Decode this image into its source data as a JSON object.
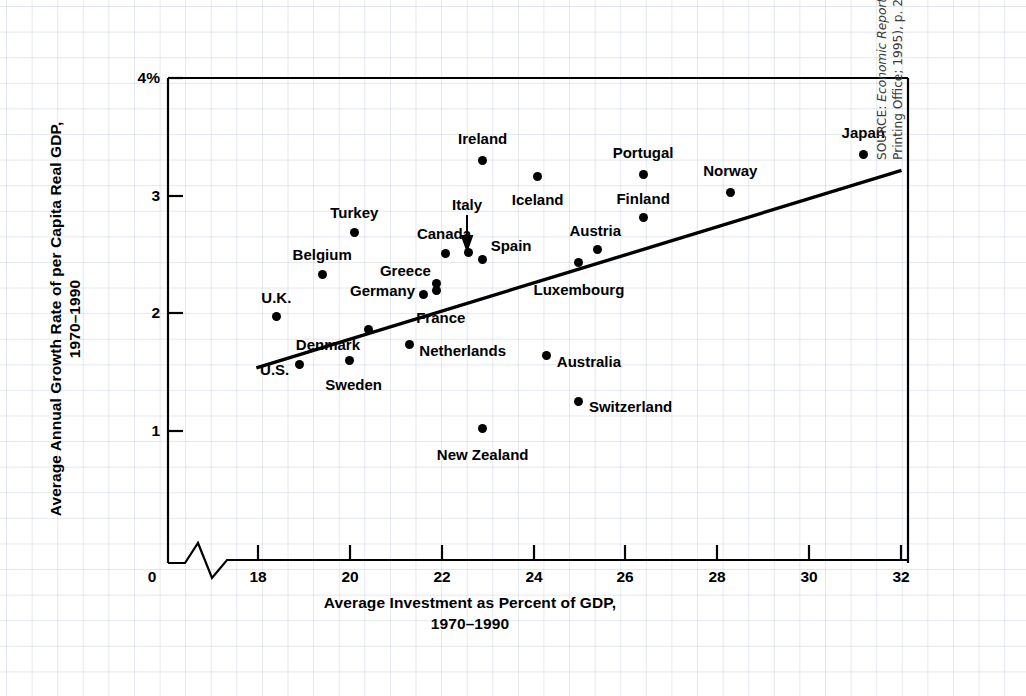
{
  "chart_data": {
    "type": "scatter",
    "title": "",
    "xlabel": "Average Investment as Percent of GDP, 1970–1990",
    "ylabel": "Average Annual Growth Rate of per Capita Real GDP, 1970–1990",
    "xlabel_line1": "Average Investment as Percent of GDP,",
    "xlabel_line2": "1970–1990",
    "ylabel_line1": "Average Annual Growth Rate of per Capita Real GDP,",
    "ylabel_line2": "1970–1990",
    "xlim": [
      18,
      32
    ],
    "ylim": [
      0,
      4
    ],
    "x_ticks": [
      "0",
      "18",
      "20",
      "22",
      "24",
      "26",
      "28",
      "30",
      "32"
    ],
    "y_ticks": [
      "4%",
      "3",
      "2",
      "1",
      "0"
    ],
    "axis_break": true,
    "grid": true,
    "legend": "none",
    "points": [
      {
        "label": "U.K.",
        "x": 18.4,
        "y": 1.97
      },
      {
        "label": "U.S.",
        "x": 18.9,
        "y": 1.56
      },
      {
        "label": "Belgium",
        "x": 19.4,
        "y": 2.33
      },
      {
        "label": "Turkey",
        "x": 20.1,
        "y": 2.69
      },
      {
        "label": "Sweden",
        "x": 20.0,
        "y": 1.6
      },
      {
        "label": "Denmark",
        "x": 20.4,
        "y": 1.86
      },
      {
        "label": "Netherlands",
        "x": 21.3,
        "y": 1.73
      },
      {
        "label": "Germany",
        "x": 21.6,
        "y": 2.16
      },
      {
        "label": "Greece",
        "x": 21.9,
        "y": 2.25
      },
      {
        "label": "France",
        "x": 21.9,
        "y": 2.19
      },
      {
        "label": "Canada",
        "x": 22.1,
        "y": 2.51
      },
      {
        "label": "Italy",
        "x": 22.6,
        "y": 2.52
      },
      {
        "label": "Spain",
        "x": 22.9,
        "y": 2.46
      },
      {
        "label": "Ireland",
        "x": 22.9,
        "y": 3.3
      },
      {
        "label": "New Zealand",
        "x": 22.9,
        "y": 1.02
      },
      {
        "label": "Iceland",
        "x": 24.1,
        "y": 3.16
      },
      {
        "label": "Australia",
        "x": 24.3,
        "y": 1.64
      },
      {
        "label": "Luxembourg",
        "x": 25.0,
        "y": 2.43
      },
      {
        "label": "Switzerland",
        "x": 25.0,
        "y": 1.25
      },
      {
        "label": "Austria",
        "x": 25.4,
        "y": 2.54
      },
      {
        "label": "Finland",
        "x": 26.4,
        "y": 2.81
      },
      {
        "label": "Portugal",
        "x": 26.4,
        "y": 3.18
      },
      {
        "label": "Norway",
        "x": 28.3,
        "y": 3.03
      },
      {
        "label": "Japan",
        "x": 31.2,
        "y": 3.35
      }
    ],
    "trend_line": {
      "description": "fitted regression line",
      "x_start": 18.0,
      "y_start": 1.54,
      "x_end": 32.0,
      "y_end": 3.21
    },
    "callout": {
      "label": "Italy",
      "note": "arrow points down to the Italy data point"
    }
  },
  "source": {
    "prefix": "SOURCE: ",
    "italic_title": "Economic Report of the President",
    "rest": " (Washington, D.C.: U.S. Government Printing Office; 1995), p. 28.",
    "full": "SOURCE: Economic Report of the President (Washington, D.C.: U.S. Government Printing Office; 1995), p. 28."
  },
  "colors": {
    "ink": "#000000",
    "grid": "#9aa8bd",
    "paper": "#ffffff",
    "source_text": "#3a3a3a"
  }
}
